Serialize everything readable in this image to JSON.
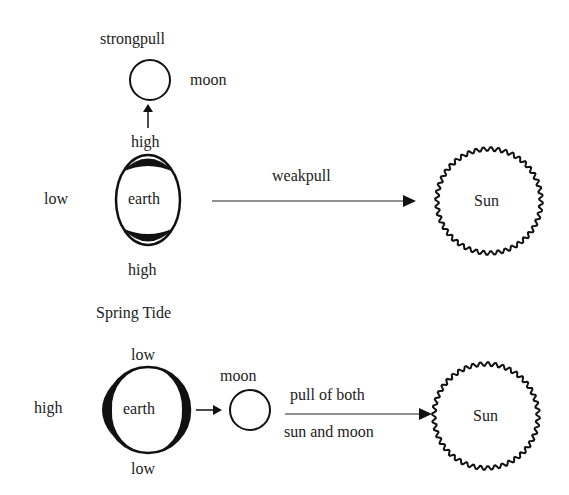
{
  "top": {
    "strong_pull": "strongpull",
    "moon": "moon",
    "high_top": "high",
    "low_left": "low",
    "earth": "earth",
    "high_bottom": "high",
    "weak_pull": "weakpull",
    "sun": "Sun"
  },
  "bottom": {
    "title": "Spring Tide",
    "low_top": "low",
    "high_left": "high",
    "earth": "earth",
    "low_bottom": "low",
    "moon": "moon",
    "pull_line1": "pull of both",
    "pull_line2": "sun and moon",
    "sun": "Sun"
  }
}
